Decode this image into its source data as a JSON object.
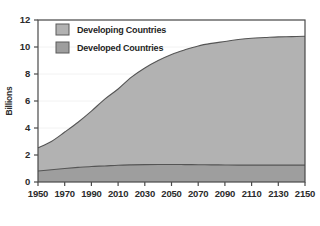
{
  "chart_data": {
    "type": "area",
    "title": "",
    "subtitle": "",
    "xlabel": "",
    "ylabel": "Billions",
    "xlim": [
      1950,
      2150
    ],
    "ylim": [
      0,
      12
    ],
    "xticks": [
      1950,
      1970,
      1990,
      2010,
      2030,
      2050,
      2070,
      2090,
      2110,
      2130,
      2150
    ],
    "yticks": [
      0,
      2,
      4,
      6,
      8,
      10,
      12
    ],
    "xtick_labels": [
      "1950",
      "1970",
      "1990",
      "2010",
      "2030",
      "2050",
      "2070",
      "2090",
      "2110",
      "2130",
      "2150"
    ],
    "ytick_labels": [
      "0",
      "2",
      "4",
      "6",
      "8",
      "10",
      "12"
    ],
    "grid": true,
    "grid_axis": "y",
    "stacked": true,
    "legend_position": "top-left",
    "x": [
      1950,
      1960,
      1970,
      1980,
      1990,
      2000,
      2010,
      2020,
      2030,
      2040,
      2050,
      2060,
      2070,
      2080,
      2090,
      2100,
      2110,
      2120,
      2130,
      2140,
      2150
    ],
    "series": [
      {
        "name": "Developed Countries",
        "color": "#9e9e9e",
        "values": [
          0.81,
          0.91,
          1.0,
          1.08,
          1.15,
          1.19,
          1.24,
          1.27,
          1.29,
          1.3,
          1.3,
          1.29,
          1.28,
          1.27,
          1.26,
          1.25,
          1.25,
          1.25,
          1.25,
          1.25,
          1.25
        ]
      },
      {
        "name": "Developing Countries",
        "color": "#b2b2b2",
        "values": [
          1.72,
          2.09,
          2.7,
          3.35,
          4.1,
          4.95,
          5.65,
          6.5,
          7.16,
          7.7,
          8.15,
          8.5,
          8.8,
          9.0,
          9.15,
          9.3,
          9.4,
          9.45,
          9.5,
          9.52,
          9.55
        ]
      }
    ],
    "totals": [
      2.53,
      3.0,
      3.7,
      4.43,
      5.25,
      6.14,
      6.89,
      7.77,
      8.45,
      9.0,
      9.45,
      9.79,
      10.08,
      10.27,
      10.41,
      10.55,
      10.65,
      10.7,
      10.75,
      10.77,
      10.8
    ],
    "annotations": []
  },
  "legend": {
    "items": [
      {
        "label": "Developing Countries",
        "swatch_color": "#b2b2b2"
      },
      {
        "label": "Developed Countries",
        "swatch_color": "#9e9e9e"
      }
    ]
  },
  "axes": {
    "y_title": "Billions",
    "y_tick_0": "0",
    "y_tick_1": "2",
    "y_tick_2": "4",
    "y_tick_3": "6",
    "y_tick_4": "8",
    "y_tick_5": "10",
    "y_tick_6": "12",
    "x_tick_0": "1950",
    "x_tick_1": "1970",
    "x_tick_2": "1990",
    "x_tick_3": "2010",
    "x_tick_4": "2030",
    "x_tick_5": "2050",
    "x_tick_6": "2070",
    "x_tick_7": "2090",
    "x_tick_8": "2110",
    "x_tick_9": "2130",
    "x_tick_10": "2150"
  },
  "colors": {
    "developing_fill": "#b2b2b2",
    "developed_fill": "#9e9e9e",
    "line": "#555555",
    "frame": "#4a4a4a",
    "grid": "#f2f2f2",
    "background": "#ffffff",
    "text": "#2b2b2b"
  }
}
